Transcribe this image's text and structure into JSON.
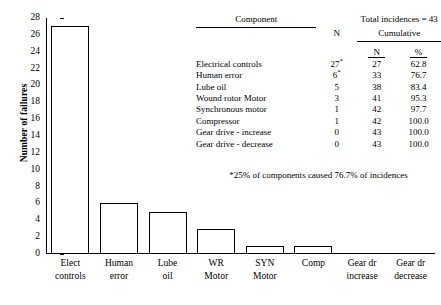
{
  "chart_data": {
    "type": "bar",
    "title": "",
    "xlabel": "",
    "ylabel": "Number of failures",
    "ylim": [
      0,
      28
    ],
    "ytick_step": 2,
    "yticks": [
      0,
      2,
      4,
      6,
      8,
      10,
      12,
      14,
      16,
      18,
      20,
      22,
      24,
      26,
      28
    ],
    "grid": false,
    "legend": "none",
    "categories": [
      "Elect controls",
      "Human error",
      "Lube oil",
      "WR Motor",
      "SYN Motor",
      "Comp",
      "Gear dr increase",
      "Gear dr decrease"
    ],
    "category_lines": [
      [
        "Elect",
        "controls"
      ],
      [
        "Human",
        "error"
      ],
      [
        "Lube",
        "oil"
      ],
      [
        "WR",
        "Motor"
      ],
      [
        "SYN",
        "Motor"
      ],
      [
        "Comp",
        ""
      ],
      [
        "Gear dr",
        "increase"
      ],
      [
        "Gear dr",
        "decrease"
      ]
    ],
    "values": [
      27,
      6,
      5,
      3,
      1,
      1,
      0,
      0
    ],
    "bar_style": {
      "fill": "#ffffff",
      "edge": "#000000"
    }
  },
  "table": {
    "header": {
      "component": "Component",
      "total_incidences": "Total incidences = 43",
      "n": "N",
      "cumulative": "Cumulative",
      "cumulative_n": "N",
      "cumulative_pct": "%"
    },
    "rows": [
      {
        "component": "Electrical controls",
        "n": "27",
        "n_mark": "*",
        "cum_n": "27",
        "cum_pct": "62.8"
      },
      {
        "component": "Human error",
        "n": "6",
        "n_mark": "*",
        "cum_n": "33",
        "cum_pct": "76.7"
      },
      {
        "component": "Lube oil",
        "n": "5",
        "n_mark": "",
        "cum_n": "38",
        "cum_pct": "83.4"
      },
      {
        "component": "Wound rotor Motor",
        "n": "3",
        "n_mark": "",
        "cum_n": "41",
        "cum_pct": "95.3"
      },
      {
        "component": "Synchronous motor",
        "n": "1",
        "n_mark": "",
        "cum_n": "42",
        "cum_pct": "97.7"
      },
      {
        "component": "Compressor",
        "n": "1",
        "n_mark": "",
        "cum_n": "42",
        "cum_pct": "100.0"
      },
      {
        "component": "Gear drive - increase",
        "n": "0",
        "n_mark": "",
        "cum_n": "43",
        "cum_pct": "100.0"
      },
      {
        "component": "Gear drive - decrease",
        "n": "0",
        "n_mark": "",
        "cum_n": "43",
        "cum_pct": "100.0"
      }
    ],
    "footnote": "*25% of components caused 76.7% of incidences"
  }
}
